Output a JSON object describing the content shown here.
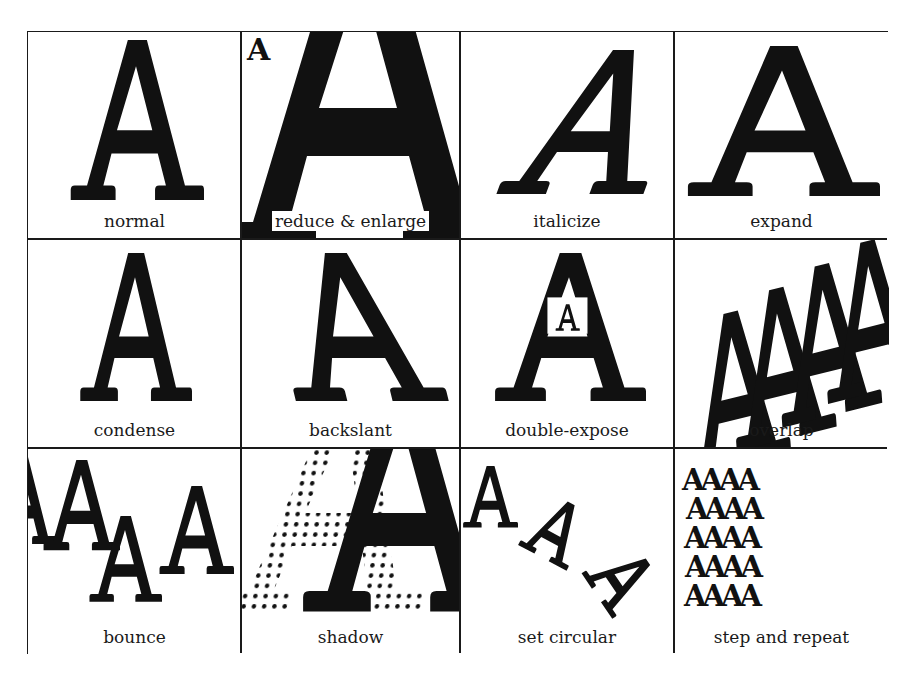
{
  "figure": {
    "colors": {
      "ink": "#111111",
      "paper": "#ffffff",
      "rule": "#1a1a1a"
    },
    "glyph": "A",
    "cells": [
      {
        "id": "normal",
        "label": "normal"
      },
      {
        "id": "reduce-enlarge",
        "label": "reduce & enlarge",
        "small_glyph": "A"
      },
      {
        "id": "italicize",
        "label": "italicize"
      },
      {
        "id": "expand",
        "label": "expand"
      },
      {
        "id": "condense",
        "label": "condense"
      },
      {
        "id": "backslant",
        "label": "backslant"
      },
      {
        "id": "double-expose",
        "label": "double-expose",
        "inner_glyph": "A"
      },
      {
        "id": "overlap",
        "label": "overlap"
      },
      {
        "id": "bounce",
        "label": "bounce"
      },
      {
        "id": "shadow",
        "label": "shadow"
      },
      {
        "id": "set-circular",
        "label": "set circular"
      },
      {
        "id": "step-and-repeat",
        "label": "step and repeat",
        "rows": [
          "AAAA",
          "AAAA",
          "AAAA",
          "AAAA",
          "AAAA"
        ]
      }
    ]
  }
}
